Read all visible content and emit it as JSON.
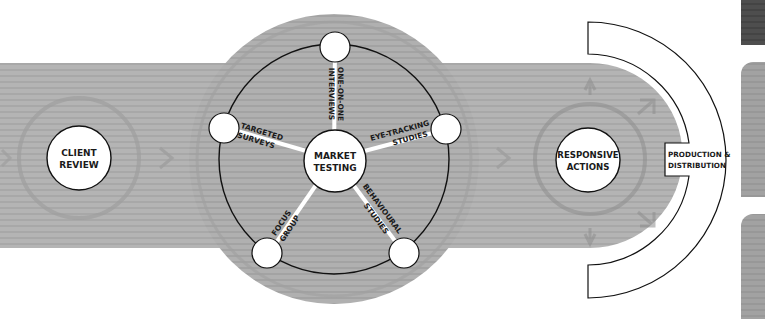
{
  "diagram": {
    "colors": {
      "band": "#b4b4b4",
      "band_stripe": "#a6a6a6",
      "hub_disc": "#b0b0b0",
      "ghost_ring": "#9a9a9a",
      "node_fill": "#ffffff",
      "outline": "#111111",
      "spoke": "#ffffff",
      "side_panel_dark": "#4a4a4a",
      "side_panel_light": "#9e9e9e"
    },
    "stages": [
      {
        "id": "client-review",
        "line1": "CLIENT",
        "line2": "REVIEW"
      },
      {
        "id": "market-testing",
        "line1": "MARKET",
        "line2": "TESTING"
      },
      {
        "id": "responsive-actions",
        "line1": "RESPONSIVE",
        "line2": "ACTIONS"
      }
    ],
    "methods": [
      {
        "id": "one-on-one-interviews",
        "line1": "ONE-ON-ONE",
        "line2": "INTERVIEWS"
      },
      {
        "id": "eye-tracking-studies",
        "line1": "EYE-TRACKING",
        "line2": "STUDIES"
      },
      {
        "id": "behavioural-studies",
        "line1": "BEHAVIOURAL",
        "line2": "STUDIES"
      },
      {
        "id": "focus-group",
        "line1": "FOCUS",
        "line2": "GROUP"
      },
      {
        "id": "targeted-surveys",
        "line1": "TARGETED",
        "line2": "SURVEYS"
      }
    ],
    "output_label": {
      "line1": "PRODUCTION &",
      "line2": "DISTRIBUTION"
    }
  }
}
